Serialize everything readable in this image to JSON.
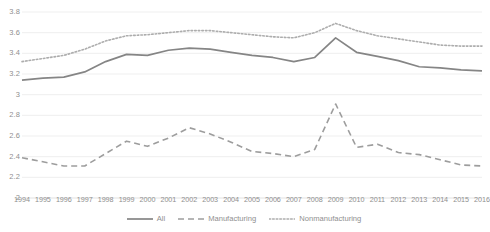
{
  "chart_data": {
    "type": "line",
    "title": "",
    "subtitle": "",
    "xlabel": "",
    "ylabel": "",
    "ylim": [
      2,
      3.8
    ],
    "ytick_step": 0.2,
    "grid": true,
    "legend_position": "bottom",
    "categories": [
      "1994",
      "1995",
      "1996",
      "1997",
      "1998",
      "1999",
      "2000",
      "2001",
      "2002",
      "2003",
      "2004",
      "2005",
      "2006",
      "2007",
      "2008",
      "2009",
      "2010",
      "2011",
      "2012",
      "2013",
      "2014",
      "2015",
      "2016"
    ],
    "ytick_labels": [
      "2",
      "2.2",
      "2.4",
      "2.6",
      "2.8",
      "3",
      "3.2",
      "3.4",
      "3.6",
      "3.8"
    ],
    "ytick_values": [
      2,
      2.2,
      2.4,
      2.6,
      2.8,
      3.0,
      3.2,
      3.4,
      3.6,
      3.8
    ],
    "series": [
      {
        "name": "All",
        "style": "solid",
        "color": "#858585",
        "values": [
          3.14,
          3.16,
          3.17,
          3.22,
          3.32,
          3.39,
          3.38,
          3.43,
          3.45,
          3.44,
          3.41,
          3.38,
          3.36,
          3.32,
          3.36,
          3.55,
          3.41,
          3.37,
          3.33,
          3.27,
          3.26,
          3.24,
          3.23
        ]
      },
      {
        "name": "Manufacturing",
        "style": "dashed",
        "color": "#9d9d9d",
        "values": [
          2.39,
          2.35,
          2.31,
          2.31,
          2.43,
          2.55,
          2.5,
          2.58,
          2.68,
          2.62,
          2.54,
          2.45,
          2.43,
          2.4,
          2.47,
          2.91,
          2.49,
          2.52,
          2.44,
          2.42,
          2.37,
          2.32,
          2.31
        ]
      },
      {
        "name": "Nonmanufacturing",
        "style": "dotted",
        "color": "#adadad",
        "values": [
          3.32,
          3.35,
          3.38,
          3.44,
          3.52,
          3.57,
          3.58,
          3.6,
          3.62,
          3.62,
          3.6,
          3.58,
          3.56,
          3.55,
          3.6,
          3.69,
          3.62,
          3.57,
          3.54,
          3.51,
          3.48,
          3.47,
          3.47
        ]
      }
    ]
  },
  "legend": {
    "items": [
      {
        "label": "All"
      },
      {
        "label": "Manufacturing"
      },
      {
        "label": "Nonmanufacturing"
      }
    ]
  },
  "colors": {
    "background": "#ffffff",
    "gridline": "#e8e8e8",
    "text": "#8f8f8f"
  }
}
